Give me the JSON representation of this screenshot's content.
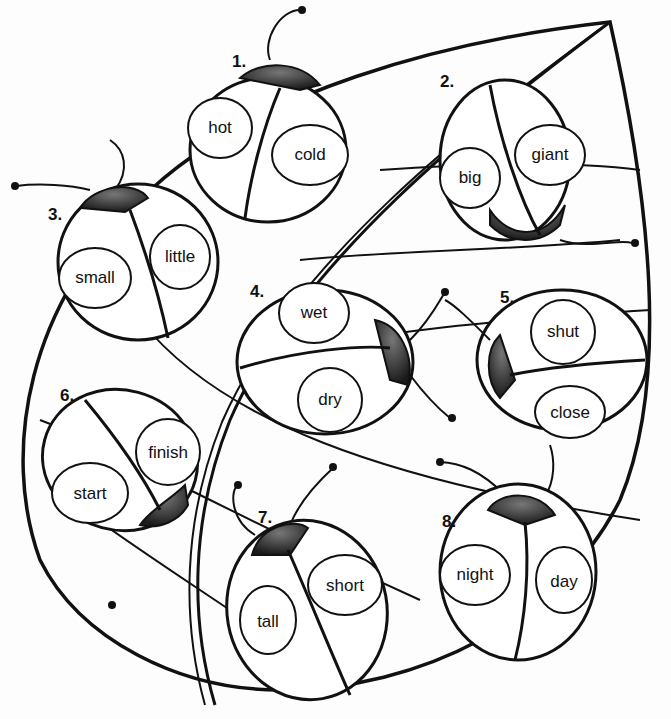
{
  "worksheet": {
    "type": "synonyms and antonyms ladybug leaf worksheet",
    "ladybugs": [
      {
        "number": "1.",
        "words": [
          "hot",
          "cold"
        ]
      },
      {
        "number": "2.",
        "words": [
          "big",
          "giant"
        ]
      },
      {
        "number": "3.",
        "words": [
          "small",
          "little"
        ]
      },
      {
        "number": "4.",
        "words": [
          "wet",
          "dry"
        ]
      },
      {
        "number": "5.",
        "words": [
          "shut",
          "close"
        ]
      },
      {
        "number": "6.",
        "words": [
          "start",
          "finish"
        ]
      },
      {
        "number": "7.",
        "words": [
          "tall",
          "short"
        ]
      },
      {
        "number": "8.",
        "words": [
          "night",
          "day"
        ]
      }
    ]
  },
  "colors": {
    "ink": "#111111",
    "paper": "#fdfdfd",
    "head": "#2a2a2a"
  }
}
